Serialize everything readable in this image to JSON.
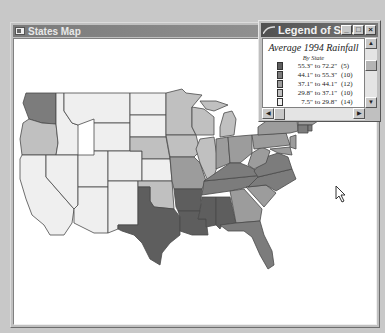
{
  "main_window": {
    "title": "States Map",
    "icon": "map-window-icon"
  },
  "legend_window": {
    "title": "Legend of St...",
    "icon": "legend-window-icon",
    "buttons": {
      "minimize": "_",
      "maximize": "□",
      "close": "×"
    },
    "heading": "Average 1994 Rainfall",
    "subheading": "By State",
    "entries": [
      {
        "range": "55.3\" to 72.2\"",
        "count": "(5)",
        "color": "#5e5e5e"
      },
      {
        "range": "44.1\" to 55.3\"",
        "count": "(10)",
        "color": "#7c7c7c"
      },
      {
        "range": "37.1\" to 44.1\"",
        "count": "(12)",
        "color": "#9c9c9c"
      },
      {
        "range": "29.8\" to 37.1\"",
        "count": "(10)",
        "color": "#c0c0c0"
      },
      {
        "range": "7.5\" to 29.8\"",
        "count": "(14)",
        "color": "#f0f0f0"
      }
    ],
    "scroll_up": "▲",
    "scroll_down": "▼",
    "scroll_left": "◀",
    "scroll_right": "▶"
  },
  "map": {
    "colors": {
      "c1": "#5e5e5e",
      "c2": "#7c7c7c",
      "c3": "#9c9c9c",
      "c4": "#c0c0c0",
      "c5": "#efefef",
      "stroke": "#4a4a4a"
    }
  },
  "cursor": "arrow-cursor-icon"
}
